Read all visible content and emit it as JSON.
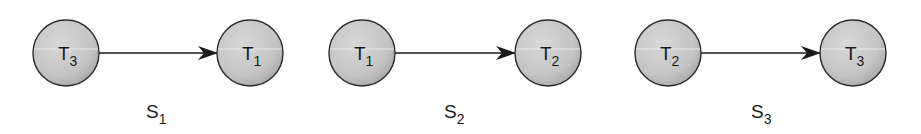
{
  "figure": {
    "graphs": [
      {
        "label": "S",
        "label_sub": "1",
        "from": {
          "label": "T",
          "sub": "3"
        },
        "to": {
          "label": "T",
          "sub": "1"
        }
      },
      {
        "label": "S",
        "label_sub": "2",
        "from": {
          "label": "T",
          "sub": "1"
        },
        "to": {
          "label": "T",
          "sub": "2"
        }
      },
      {
        "label": "S",
        "label_sub": "3",
        "from": {
          "label": "T",
          "sub": "2"
        },
        "to": {
          "label": "T",
          "sub": "3"
        }
      }
    ],
    "colors": {
      "node_fill": "#c9c9c9",
      "node_stroke": "#2a2a2a",
      "edge": "#1a1a1a"
    }
  }
}
